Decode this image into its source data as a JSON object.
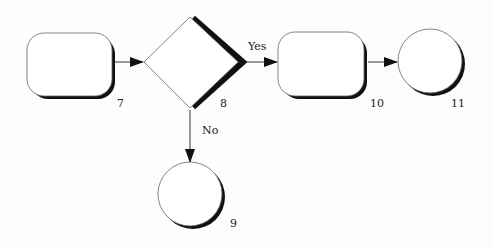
{
  "diagram": {
    "type": "flowchart",
    "colors": {
      "stroke": "#555555",
      "shadow": "#111111",
      "fill": "#ffffff",
      "text": "#222222"
    },
    "nodes": [
      {
        "id": "7",
        "shape": "rounded-rectangle",
        "label": "7"
      },
      {
        "id": "8",
        "shape": "diamond",
        "label": "8"
      },
      {
        "id": "10",
        "shape": "rounded-rectangle",
        "label": "10"
      },
      {
        "id": "11",
        "shape": "circle",
        "label": "11"
      },
      {
        "id": "9",
        "shape": "circle",
        "label": "9"
      }
    ],
    "edges": [
      {
        "from": "7",
        "to": "8",
        "label": ""
      },
      {
        "from": "8",
        "to": "10",
        "label": "Yes"
      },
      {
        "from": "10",
        "to": "11",
        "label": ""
      },
      {
        "from": "8",
        "to": "9",
        "label": "No"
      }
    ]
  }
}
